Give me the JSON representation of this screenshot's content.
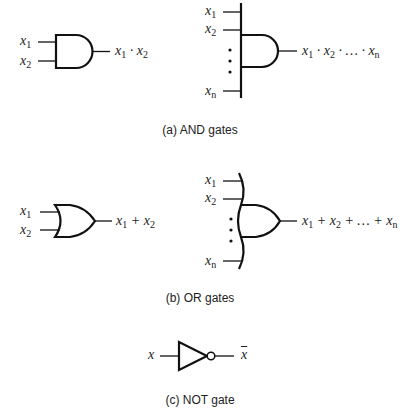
{
  "figure": {
    "and_section": {
      "caption": "(a) AND gates",
      "two_input": {
        "inputs": [
          {
            "var": "x",
            "sub": "1"
          },
          {
            "var": "x",
            "sub": "2"
          }
        ],
        "output": "x1 · x2",
        "output_parts": [
          {
            "var": "x",
            "sub": "1"
          },
          {
            "op": " · "
          },
          {
            "var": "x",
            "sub": "2"
          }
        ]
      },
      "n_input": {
        "inputs": [
          {
            "var": "x",
            "sub": "1"
          },
          {
            "var": "x",
            "sub": "2"
          },
          {
            "var": "x",
            "sub": "n"
          }
        ],
        "output": "x1 · x2 · … · xn",
        "output_parts": [
          {
            "var": "x",
            "sub": "1"
          },
          {
            "op": " · "
          },
          {
            "var": "x",
            "sub": "2"
          },
          {
            "op": " · … · "
          },
          {
            "var": "x",
            "sub": "n"
          }
        ]
      }
    },
    "or_section": {
      "caption": "(b) OR gates",
      "two_input": {
        "inputs": [
          {
            "var": "x",
            "sub": "1"
          },
          {
            "var": "x",
            "sub": "2"
          }
        ],
        "output": "x1 + x2",
        "output_parts": [
          {
            "var": "x",
            "sub": "1"
          },
          {
            "op": " + "
          },
          {
            "var": "x",
            "sub": "2"
          }
        ]
      },
      "n_input": {
        "inputs": [
          {
            "var": "x",
            "sub": "1"
          },
          {
            "var": "x",
            "sub": "2"
          },
          {
            "var": "x",
            "sub": "n"
          }
        ],
        "output": "x1 + x2 + … + xn",
        "output_parts": [
          {
            "var": "x",
            "sub": "1"
          },
          {
            "op": " + "
          },
          {
            "var": "x",
            "sub": "2"
          },
          {
            "op": " + … + "
          },
          {
            "var": "x",
            "sub": "n"
          }
        ]
      }
    },
    "not_section": {
      "caption": "(c) NOT gate",
      "input": "x",
      "output": "x̄",
      "output_var": "x"
    },
    "colors": {
      "stroke": "#111111",
      "text": "#222222",
      "background": "#ffffff"
    }
  }
}
